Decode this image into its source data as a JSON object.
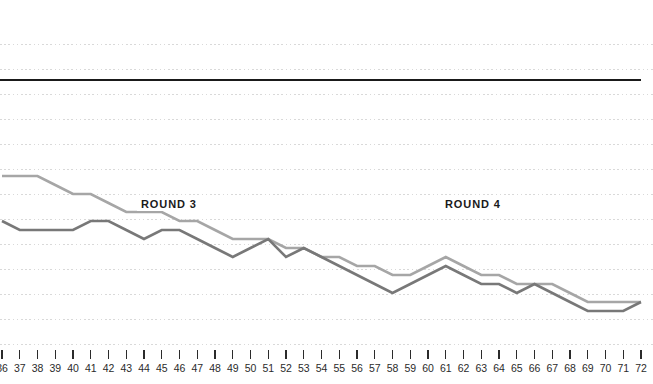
{
  "chart_data": {
    "type": "line",
    "title": "",
    "subtitle": "",
    "xlabel": "",
    "ylabel": "",
    "grid": "horizontal-dotted",
    "legend_position": "none",
    "xlim": [
      36,
      72
    ],
    "ylim": [
      0,
      100
    ],
    "categories": [
      36,
      37,
      38,
      39,
      40,
      41,
      42,
      43,
      44,
      45,
      46,
      47,
      48,
      49,
      50,
      51,
      52,
      53,
      54,
      55,
      56,
      57,
      58,
      59,
      60,
      61,
      62,
      63,
      64,
      65,
      66,
      67,
      68,
      69,
      70,
      71,
      72
    ],
    "tick_labels": [
      "36",
      "37",
      "38",
      "39",
      "40",
      "41",
      "42",
      "43",
      "44",
      "45",
      "46",
      "47",
      "48",
      "49",
      "50",
      "51",
      "52",
      "53",
      "54",
      "55",
      "56",
      "57",
      "58",
      "59",
      "60",
      "61",
      "62",
      "63",
      "64",
      "65",
      "66",
      "67",
      "68",
      "69",
      "70",
      "71",
      "72"
    ],
    "series": [
      {
        "name": "upper-line",
        "color": "#a6a6a6",
        "values": [
          56,
          56,
          56,
          53,
          50,
          50,
          47,
          44,
          44,
          44,
          41,
          41,
          38,
          35,
          35,
          35,
          32,
          32,
          29,
          29,
          26,
          26,
          23,
          23,
          26,
          29,
          26,
          23,
          23,
          20,
          20,
          20,
          17,
          14,
          14,
          14,
          14
        ]
      },
      {
        "name": "lower-line",
        "color": "#787878",
        "values": [
          41,
          38,
          38,
          38,
          38,
          41,
          41,
          38,
          35,
          38,
          38,
          35,
          32,
          29,
          32,
          35,
          29,
          32,
          29,
          26,
          23,
          20,
          17,
          20,
          23,
          26,
          23,
          20,
          20,
          17,
          20,
          17,
          14,
          11,
          11,
          11,
          14
        ]
      }
    ],
    "reference_line": {
      "name": "baseline-reference",
      "color": "#1a1a1a",
      "value": 88
    },
    "gridlines": {
      "color": "#d9d9d9",
      "style": "dotted",
      "count": 13
    },
    "annotations": [
      {
        "id": "round3",
        "label": "ROUND 3",
        "x": 44
      },
      {
        "id": "round4",
        "label": "ROUND 4",
        "x": 61
      }
    ],
    "axis": {
      "tick_color": "#2b2b2b",
      "label_color": "#2b2b2b"
    }
  }
}
